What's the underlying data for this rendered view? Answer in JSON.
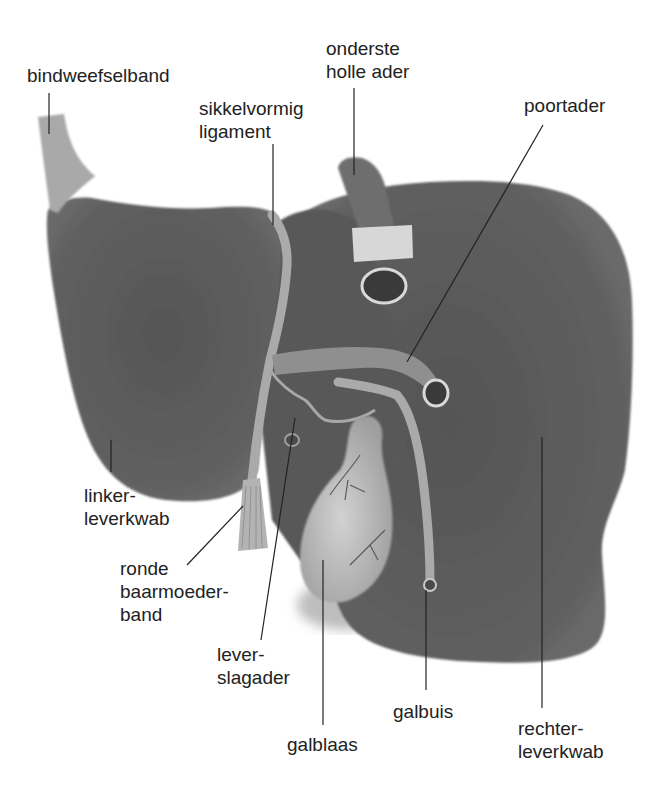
{
  "diagram": {
    "colors": {
      "background": "#ffffff",
      "liver": "#5e5e5e",
      "liver_dark": "#4a4a4a",
      "ligament": "#b5b5b5",
      "gallbladder": "#c9c9c9",
      "vessel": "#9a9a9a",
      "label_text": "#222222",
      "leader_line": "#222222"
    },
    "labels": [
      {
        "id": "bindweefselband",
        "text": "bindweefselband",
        "x": 27,
        "y": 64
      },
      {
        "id": "onderste-holle-ader",
        "text": "onderste\nholle ader",
        "x": 326,
        "y": 37
      },
      {
        "id": "sikkelvormig-ligament",
        "text": "sikkelvormig\nligament",
        "x": 199,
        "y": 97
      },
      {
        "id": "poortader",
        "text": "poortader",
        "x": 524,
        "y": 94
      },
      {
        "id": "linker-leverkwab",
        "text": "linker-\nleverkwab",
        "x": 84,
        "y": 484
      },
      {
        "id": "ronde-baarmoederband",
        "text": "ronde\nbaarmoeder-\nband",
        "x": 120,
        "y": 557
      },
      {
        "id": "lever-slagader",
        "text": "lever-\nslagader",
        "x": 217,
        "y": 643
      },
      {
        "id": "galbuis",
        "text": "galbuis",
        "x": 393,
        "y": 700
      },
      {
        "id": "galblaas",
        "text": "galblaas",
        "x": 287,
        "y": 733
      },
      {
        "id": "rechter-leverkwab",
        "text": "rechter-\nleverkwab",
        "x": 518,
        "y": 717
      }
    ]
  }
}
